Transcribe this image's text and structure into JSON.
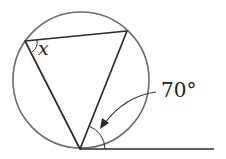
{
  "diagram": {
    "type": "geometry",
    "colors": {
      "circle": "#6b6b6b",
      "lines": "#2b2b2b",
      "text": "#222222"
    },
    "circle": {
      "cx": 81,
      "cy": 80,
      "r": 68
    },
    "triangle": {
      "vertices": [
        {
          "name": "left",
          "x": 25,
          "y": 41
        },
        {
          "name": "top-right",
          "x": 127,
          "y": 31
        },
        {
          "name": "bottom",
          "x": 80,
          "y": 149
        }
      ]
    },
    "tangent": {
      "x1": 80,
      "y1": 149,
      "x2": 214,
      "y2": 149
    },
    "labels": {
      "unknown_angle": "x",
      "given_angle": "70°"
    }
  }
}
